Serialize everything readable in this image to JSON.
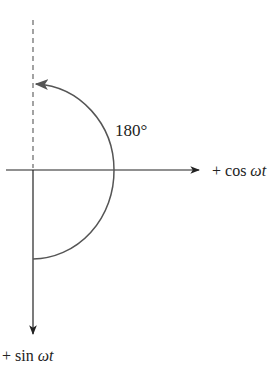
{
  "diagram": {
    "angle_label": "180°",
    "x_axis_label_prefix": "+ cos ",
    "x_axis_label_var": "ωt",
    "y_axis_label_prefix": "+ sin ",
    "y_axis_label_var": "ωt",
    "colors": {
      "axis": "#222222",
      "arc": "#555555",
      "dashed": "#666666"
    }
  }
}
